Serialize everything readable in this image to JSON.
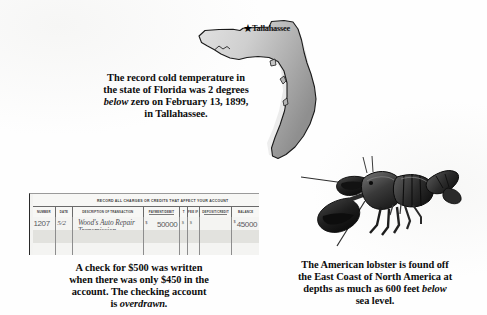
{
  "page": {
    "background_color": "#fdfdfd",
    "text_color": "#0d0d0d"
  },
  "florida_panel": {
    "map_name": "florida-state-map",
    "marker_label": "Tallahassee",
    "marker_icon": "star-marker-icon",
    "map_fill_light": "#d8d8d8",
    "map_fill_dark": "#9e9e9e",
    "map_outline": "#1a1a1a",
    "caption": {
      "line1": "The record cold temperature in",
      "line2": "the state of Florida was 2 degrees",
      "line3_italic": "below",
      "line3_rest": " zero on February 13, 1899,",
      "line4": "in Tallahassee."
    }
  },
  "check_register": {
    "title": "RECORD ALL CHARGES OR CREDITS THAT AFFECT YOUR ACCOUNT",
    "columns": [
      {
        "id": "number",
        "label": "NUMBER"
      },
      {
        "id": "date",
        "label": "DATE"
      },
      {
        "id": "description",
        "label": "DESCRIPTION OF TRANSACTION"
      },
      {
        "id": "payment",
        "label": "PAYMENT/DEBIT",
        "sublabel": "(-)"
      },
      {
        "id": "tick",
        "label": "T"
      },
      {
        "id": "fee",
        "label": "FEE IF ANY",
        "sublabel": "(-)"
      },
      {
        "id": "deposit",
        "label": "DEPOSIT/CREDIT",
        "sublabel": "(+)"
      },
      {
        "id": "balance",
        "label": "BALANCE"
      }
    ],
    "entry": {
      "number": "1207",
      "date": "5/2",
      "description_line1": "Wood's Auto Repair",
      "description_line2": "Transmission",
      "payment_dollars": "500",
      "payment_cents": "00",
      "payment_symbol": "$",
      "tick": "$",
      "balance_dollars": "450",
      "balance_cents": "00",
      "balance_symbol": "$"
    },
    "caption": {
      "line1": "A check for $500 was written",
      "line2": "when there was only $450 in the",
      "line3": "account. The checking account",
      "line4_rest": "is ",
      "line4_italic": "overdrawn."
    }
  },
  "lobster_panel": {
    "image_name": "american-lobster-photo",
    "caption": {
      "line1": "The American lobster is found off",
      "line2": "the East Coast of North America at",
      "line3_rest": "depths as much as 600 feet ",
      "line3_italic": "below",
      "line4": "sea level."
    }
  }
}
